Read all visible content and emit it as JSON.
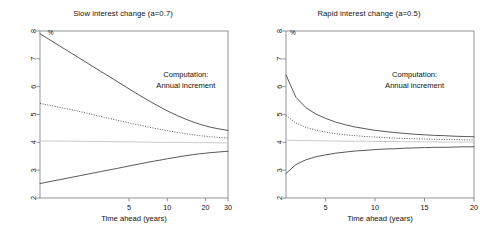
{
  "figure": {
    "background": "#ffffff",
    "curve_color": "#3a3a3a",
    "flat_color": "#bdbdbd",
    "axis_color": "#7a7a7a"
  },
  "panels": [
    {
      "id": "left",
      "title": "Slow interest change (a=0.7)",
      "unit_label": "%",
      "annotation_line1": "Computation:",
      "annotation_line2": "Annual increment"
    },
    {
      "id": "right",
      "title": "Rapid interest change (a=0.5)",
      "unit_label": "%",
      "annotation_line1": "Computation:",
      "annotation_line2": "Annual increment"
    }
  ],
  "chart_data": [
    {
      "type": "line",
      "title": "Slow interest change (a=0.7)",
      "xlabel": "Time ahead (years)",
      "ylabel": "%",
      "xscale": "log",
      "xlim": [
        1,
        30
      ],
      "ylim": [
        2,
        8
      ],
      "xticks": [
        5,
        10,
        20,
        30
      ],
      "xticklabels": [
        "5",
        "10",
        "20",
        "30"
      ],
      "yticks": [
        2,
        3,
        4,
        5,
        6,
        7,
        8
      ],
      "yticklabels": [
        "2",
        "3",
        "4",
        "5",
        "6",
        "7",
        "8"
      ],
      "grid": false,
      "legend": "none",
      "annotations": [
        {
          "text": "Computation:",
          "x": 14,
          "y": 6.35
        },
        {
          "text": "Annual increment",
          "x": 14,
          "y": 5.95
        },
        {
          "text": "%",
          "x": 1.15,
          "y": 7.85
        }
      ],
      "x": [
        1,
        2,
        3,
        4,
        5,
        6,
        7,
        8,
        9,
        10,
        12,
        14,
        16,
        18,
        20,
        22,
        25,
        28,
        30
      ],
      "series": [
        {
          "name": "upper bound",
          "style": "solid",
          "values": [
            7.9,
            7.05,
            6.55,
            6.2,
            5.92,
            5.7,
            5.52,
            5.37,
            5.24,
            5.13,
            4.96,
            4.83,
            4.73,
            4.65,
            4.59,
            4.54,
            4.49,
            4.45,
            4.43
          ]
        },
        {
          "name": "median projection",
          "style": "dotted",
          "values": [
            5.4,
            5.12,
            4.93,
            4.8,
            4.7,
            4.62,
            4.56,
            4.5,
            4.46,
            4.42,
            4.36,
            4.31,
            4.27,
            4.24,
            4.22,
            4.2,
            4.18,
            4.16,
            4.15
          ]
        },
        {
          "name": "baseline level",
          "style": "flat",
          "values": [
            4.05,
            4.04,
            4.03,
            4.02,
            4.02,
            4.01,
            4.01,
            4.0,
            4.0,
            4.0,
            4.0,
            4.0,
            3.99,
            3.99,
            3.99,
            3.99,
            3.98,
            3.98,
            3.98
          ]
        },
        {
          "name": "lower bound",
          "style": "solid",
          "values": [
            2.52,
            2.79,
            2.95,
            3.06,
            3.15,
            3.22,
            3.28,
            3.33,
            3.37,
            3.41,
            3.47,
            3.52,
            3.56,
            3.59,
            3.61,
            3.63,
            3.65,
            3.67,
            3.68
          ]
        }
      ]
    },
    {
      "type": "line",
      "title": "Rapid interest change (a=0.5)",
      "xlabel": "Time ahead (years)",
      "ylabel": "%",
      "xscale": "linear",
      "xlim": [
        1,
        20
      ],
      "ylim": [
        2,
        8
      ],
      "xticks": [
        5,
        10,
        15,
        20
      ],
      "xticklabels": [
        "5",
        "10",
        "15",
        "20"
      ],
      "yticks": [
        2,
        3,
        4,
        5,
        6,
        7,
        8
      ],
      "yticklabels": [
        "2",
        "3",
        "4",
        "5",
        "6",
        "7",
        "8"
      ],
      "grid": false,
      "legend": "none",
      "annotations": [
        {
          "text": "Computation:",
          "x": 14,
          "y": 6.35
        },
        {
          "text": "Annual increment",
          "x": 14,
          "y": 5.95
        },
        {
          "text": "%",
          "x": 1.4,
          "y": 7.85
        }
      ],
      "x": [
        1,
        2,
        3,
        4,
        5,
        6,
        7,
        8,
        9,
        10,
        11,
        12,
        13,
        14,
        15,
        16,
        17,
        18,
        19,
        20
      ],
      "series": [
        {
          "name": "upper bound",
          "style": "solid",
          "values": [
            6.42,
            5.62,
            5.25,
            5.02,
            4.86,
            4.73,
            4.63,
            4.55,
            4.49,
            4.43,
            4.39,
            4.35,
            4.32,
            4.29,
            4.27,
            4.25,
            4.24,
            4.22,
            4.21,
            4.2
          ]
        },
        {
          "name": "median projection",
          "style": "dotted",
          "values": [
            4.97,
            4.69,
            4.54,
            4.44,
            4.37,
            4.31,
            4.27,
            4.24,
            4.21,
            4.19,
            4.17,
            4.15,
            4.14,
            4.13,
            4.12,
            4.11,
            4.1,
            4.1,
            4.09,
            4.09
          ]
        },
        {
          "name": "baseline level",
          "style": "flat",
          "values": [
            4.08,
            4.07,
            4.06,
            4.06,
            4.05,
            4.05,
            4.04,
            4.04,
            4.04,
            4.03,
            4.03,
            4.03,
            4.02,
            4.02,
            4.02,
            4.02,
            4.01,
            4.01,
            4.01,
            4.01
          ]
        },
        {
          "name": "lower bound",
          "style": "solid",
          "values": [
            2.88,
            3.2,
            3.37,
            3.48,
            3.55,
            3.61,
            3.65,
            3.69,
            3.71,
            3.74,
            3.76,
            3.77,
            3.79,
            3.8,
            3.81,
            3.82,
            3.82,
            3.83,
            3.84,
            3.84
          ]
        }
      ]
    }
  ]
}
